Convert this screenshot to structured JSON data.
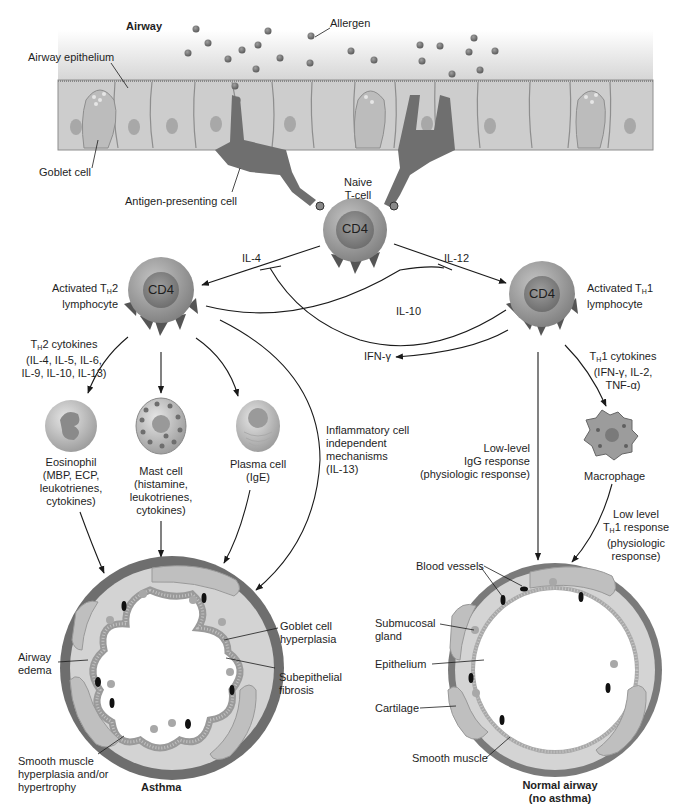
{
  "diagram": {
    "type": "biological-pathway",
    "colors": {
      "background": "#ffffff",
      "epithelium_cell": "#c9c9c9",
      "epithelium_border": "#8e8e8e",
      "airway_gradient_top": "#ffffff",
      "airway_gradient_bottom": "#d6d6d6",
      "apc": "#6f6f6f",
      "allergen": "#6b6b6b",
      "tcell_outer": "#9a9a9a",
      "tcell_inner": "#7d7d7d",
      "receptor": "#555555",
      "arrow": "#1a1a1a",
      "airway_wall": "#d2d2d2",
      "smooth_muscle": "#7a7a7a",
      "cartilage": "#bdbdbd",
      "blood_vessel": "#111111"
    },
    "airway_region": {
      "title": "Airway",
      "allergen_label": "Allergen",
      "epithelium_label": "Airway epithelium",
      "goblet_label": "Goblet cell",
      "apc_label": "Antigen-presenting cell"
    },
    "naive_tcell": {
      "label_line1": "Naive",
      "label_line2": "T-cell",
      "marker": "CD4"
    },
    "th2_cell": {
      "marker": "CD4",
      "label_line1_pre": "Activated T",
      "label_line1_sub": "H",
      "label_line1_post": "2",
      "label_line2": "lymphocyte"
    },
    "th1_cell": {
      "marker": "CD4",
      "label_line1_pre": "Activated T",
      "label_line1_sub": "H",
      "label_line1_post": "1",
      "label_line2": "lymphocyte"
    },
    "cytokine_edges": {
      "il4": "IL-4",
      "il12": "IL-12",
      "il10": "IL-10",
      "ifng": "IFN-γ"
    },
    "th2_cytokines": {
      "line1_pre": "T",
      "line1_sub": "H",
      "line1_post": "2 cytokines",
      "line2": "(IL-4, IL-5, IL-6,",
      "line3": "IL-9, IL-10, IL-13)"
    },
    "th1_cytokines": {
      "line1_pre": "T",
      "line1_sub": "H",
      "line1_post": "1 cytokines",
      "line2": "(IFN-γ, IL-2,",
      "line3": "TNF-α)"
    },
    "effector_cells": [
      {
        "name": "Eosinophil",
        "lines": [
          "Eosinophil",
          "(MBP, ECP,",
          "leukotrienes,",
          "cytokines)"
        ]
      },
      {
        "name": "Mast cell",
        "lines": [
          "Mast cell",
          "(histamine,",
          "leukotrienes,",
          "cytokines)"
        ]
      },
      {
        "name": "Plasma cell",
        "lines": [
          "Plasma cell",
          "(IgE)"
        ]
      }
    ],
    "inflammatory_independent": {
      "lines": [
        "Inflammatory cell",
        "independent",
        "mechanisms",
        "(IL-13)"
      ]
    },
    "igg_response": {
      "lines": [
        "Low-level",
        "IgG response",
        "(physiologic response)"
      ]
    },
    "macrophage": {
      "label": "Macrophage"
    },
    "low_th1": {
      "line1": "Low level",
      "line2_pre": "T",
      "line2_sub": "H",
      "line2_post": "1 response",
      "line3": "(physiologic",
      "line4": "response)"
    },
    "asthma_airway": {
      "title": "Asthma",
      "labels": {
        "goblet_hyperplasia": [
          "Goblet cell",
          "hyperplasia"
        ],
        "subepithelial_fibrosis": [
          "Subepithelial",
          "fibrosis"
        ],
        "airway_edema": [
          "Airway",
          "edema"
        ],
        "smooth_muscle": [
          "Smooth muscle",
          "hyperplasia and/or",
          "hypertrophy"
        ]
      }
    },
    "normal_airway": {
      "title_line1": "Normal airway",
      "title_line2": "(no asthma)",
      "labels": {
        "blood_vessels": "Blood vessels",
        "submucosal_gland": [
          "Submucosal",
          "gland"
        ],
        "epithelium": "Epithelium",
        "cartilage": "Cartilage",
        "smooth_muscle": "Smooth muscle"
      }
    }
  }
}
